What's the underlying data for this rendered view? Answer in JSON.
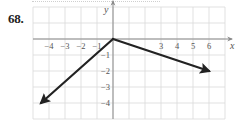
{
  "problem": {
    "number_label": "68."
  },
  "chart_data": {
    "type": "line",
    "title": "",
    "xlabel": "x",
    "ylabel": "y",
    "xlim": [
      -5,
      7
    ],
    "ylim": [
      -5,
      1
    ],
    "grid": true,
    "legend": null,
    "x_tick_labels": [
      "-4",
      "-3",
      "-2",
      "-1",
      "3",
      "4",
      "5",
      "6"
    ],
    "x_ticks": [
      -4,
      -3,
      -2,
      -1,
      3,
      4,
      5,
      6
    ],
    "y_tick_labels": [
      "-1",
      "-2",
      "-3",
      "-4"
    ],
    "y_ticks": [
      -1,
      -2,
      -3,
      -4
    ],
    "series": [
      {
        "name": "left ray",
        "points": [
          [
            0,
            0
          ],
          [
            -4.5,
            -4
          ]
        ],
        "arrow_end": true,
        "color": "#222222"
      },
      {
        "name": "right ray",
        "points": [
          [
            0,
            0
          ],
          [
            6,
            -2
          ]
        ],
        "arrow_end": true,
        "color": "#222222"
      }
    ]
  },
  "layout": {
    "origin_px": [
      113,
      39
    ],
    "unit_px": 16,
    "grid_color": "#d9d9d9",
    "axis_color": "#8a8a8a",
    "line_color": "#222222"
  }
}
